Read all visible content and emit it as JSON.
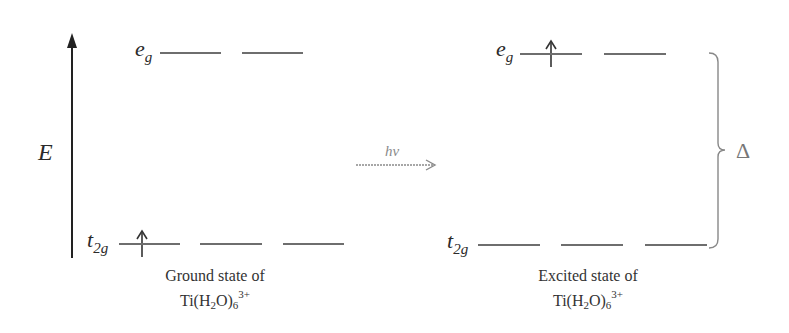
{
  "axis": {
    "label": "E",
    "direction": "up"
  },
  "transition": {
    "label": "hv",
    "direction": "left-to-right"
  },
  "gap": {
    "label": "Δ",
    "description": "brace spanning t2g to eg"
  },
  "ground_state": {
    "eg": {
      "label_main": "e",
      "label_sub": "g",
      "orbitals": 2,
      "electrons": [
        0,
        0
      ]
    },
    "t2g": {
      "label_main": "t",
      "label_sub": "2g",
      "orbitals": 3,
      "electrons": [
        1,
        0,
        0
      ]
    },
    "caption_line1": "Ground state of",
    "formula": {
      "prefix": "Ti(H",
      "sub1": "2",
      "mid": "O)",
      "sub2": "6",
      "sup": "3+"
    }
  },
  "excited_state": {
    "eg": {
      "label_main": "e",
      "label_sub": "g",
      "orbitals": 2,
      "electrons": [
        1,
        0
      ]
    },
    "t2g": {
      "label_main": "t",
      "label_sub": "2g",
      "orbitals": 3,
      "electrons": [
        0,
        0,
        0
      ]
    },
    "caption_line1": "Excited state of",
    "formula": {
      "prefix": "Ti(H",
      "sub1": "2",
      "mid": "O)",
      "sub2": "6",
      "sup": "3+"
    }
  },
  "colors": {
    "level_line": "#6e6e6e",
    "text": "#2a2a2a",
    "faint": "#888888",
    "axis": "#222222"
  }
}
